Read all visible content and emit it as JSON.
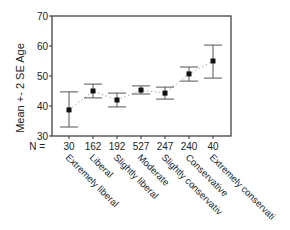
{
  "chart_data": {
    "type": "scatter",
    "subtype": "error-bar",
    "title": "",
    "xlabel": "",
    "ylabel": "Mean +- 2 SE Age",
    "ylim": [
      30,
      70
    ],
    "yticks": [
      30,
      40,
      50,
      60,
      70
    ],
    "n_prefix": "N =",
    "categories": [
      "Extremely liberal",
      "Liberal",
      "Slightly liberal",
      "Moderate",
      "Slightly conservativ",
      "Conservative",
      "Extremely conservati"
    ],
    "n": [
      30,
      162,
      192,
      527,
      247,
      240,
      40
    ],
    "series": [
      {
        "name": "Mean Age",
        "values": [
          38.7,
          45.0,
          42.0,
          45.3,
          44.3,
          50.7,
          55.0
        ],
        "upper": [
          44.7,
          47.3,
          44.3,
          46.7,
          46.3,
          53.0,
          60.3
        ],
        "lower": [
          33.0,
          42.7,
          39.7,
          44.0,
          42.3,
          48.3,
          49.3
        ]
      }
    ],
    "grid": false,
    "legend": "none",
    "connector": "dotted"
  },
  "colors": {
    "axis": "#333333",
    "marker": "#111111",
    "error_bar": "#555555",
    "connector": "#aaaaaa",
    "text": "#222222"
  }
}
